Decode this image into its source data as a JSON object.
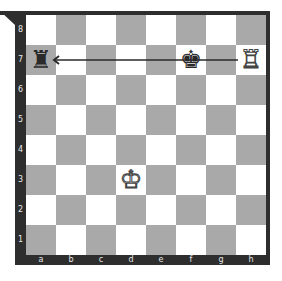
{
  "board": {
    "ranks": [
      "8",
      "7",
      "6",
      "5",
      "4",
      "3",
      "2",
      "1"
    ],
    "files": [
      "a",
      "b",
      "c",
      "d",
      "e",
      "f",
      "g",
      "h"
    ],
    "colors": {
      "light": "#ffffff",
      "dark": "#a9a9a9",
      "frame": "#2e2e2e"
    },
    "pieces": [
      {
        "square": "a7",
        "piece": "rook",
        "color": "black",
        "glyph": "♜"
      },
      {
        "square": "f7",
        "piece": "king",
        "color": "black",
        "glyph": "♚"
      },
      {
        "square": "h7",
        "piece": "rook",
        "color": "white",
        "glyph": "♖"
      },
      {
        "square": "d3",
        "piece": "king",
        "color": "white",
        "glyph": "♔"
      }
    ],
    "arrows": [
      {
        "from": "h7",
        "to": "a7"
      }
    ]
  }
}
